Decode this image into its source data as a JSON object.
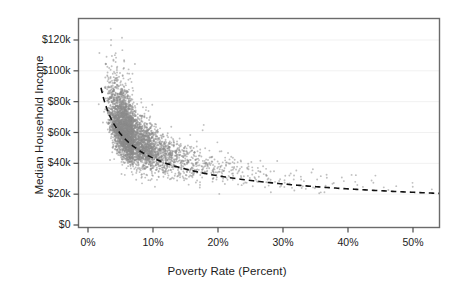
{
  "chart_data": {
    "type": "scatter",
    "title": "",
    "subtitle": "",
    "xlabel": "Poverty Rate (Percent)",
    "ylabel": "Median Household Income",
    "xlim": [
      0,
      54
    ],
    "ylim": [
      0,
      132000
    ],
    "xticks": [
      0,
      10,
      20,
      30,
      40,
      50
    ],
    "xticklabels": [
      "0%",
      "10%",
      "20%",
      "30%",
      "40%",
      "50%"
    ],
    "yticks": [
      0,
      20000,
      40000,
      60000,
      80000,
      100000,
      120000
    ],
    "yticklabels": [
      "$0",
      "$20k",
      "$40k",
      "$60k",
      "$80k",
      "$100k",
      "$120k"
    ],
    "grid": "horizontal-faint",
    "legend": "none",
    "point_color": "#8c8c8c",
    "point_opacity": 0.55,
    "point_size": 1.9,
    "frame_color": "#6b6b6b",
    "trendline": {
      "style": "dashed",
      "color": "#111111",
      "width": 1.6,
      "shape": "power-decay",
      "x_start": 2.0,
      "y_start": 89000,
      "x_end": 54.0,
      "y_end": 20500,
      "description": "Dashed fitted curve decaying from about $89k at 2% poverty to about $20.5k at 54% poverty"
    },
    "series": [
      {
        "name": "U.S. counties",
        "n_points": 3140,
        "x": [
          1.9,
          2.4,
          2.6,
          2.8,
          3.0,
          3.1,
          3.2,
          3.3,
          3.4,
          3.5,
          3.6,
          3.7,
          3.8,
          3.9,
          4.0,
          4.1,
          4.2,
          4.3,
          4.4,
          4.5,
          4.6,
          4.7,
          4.8,
          4.9,
          5.0,
          5.1,
          5.2,
          5.3,
          5.4,
          5.5,
          5.6,
          5.7,
          5.8,
          5.9,
          6.0,
          6.1,
          6.2,
          6.3,
          6.4,
          6.5,
          6.6,
          6.7,
          6.8,
          6.9,
          7.0,
          7.2,
          7.4,
          7.6,
          7.8,
          8.0,
          8.2,
          8.4,
          8.6,
          8.8,
          9.0,
          9.2,
          9.4,
          9.6,
          9.8,
          10.0,
          10.3,
          10.6,
          10.9,
          11.2,
          11.5,
          11.8,
          12.1,
          12.4,
          12.7,
          13.0,
          13.4,
          13.8,
          14.2,
          14.6,
          15.0,
          15.4,
          15.8,
          16.2,
          16.6,
          17.0,
          17.5,
          18.0,
          18.5,
          19.0,
          19.5,
          20.0,
          20.5,
          21.0,
          21.5,
          22.0,
          22.6,
          23.2,
          23.8,
          24.4,
          25.0,
          25.7,
          26.4,
          27.1,
          27.8,
          28.5,
          29.3,
          30.1,
          30.9,
          31.7,
          32.5,
          33.4,
          34.3,
          35.2,
          36.1,
          37.0,
          38.2,
          39.4,
          40.6,
          41.8,
          43.0,
          44.5,
          46.0,
          47.5,
          49.0,
          51.0,
          53.0
        ],
        "y_median": [
          86000,
          84000,
          82000,
          79000,
          77000,
          76000,
          75000,
          74000,
          73000,
          72000,
          71000,
          70500,
          70000,
          69000,
          68500,
          68000,
          67500,
          67000,
          66500,
          66000,
          65500,
          65000,
          64500,
          64000,
          63500,
          63000,
          62500,
          62000,
          61500,
          61000,
          60500,
          60000,
          59500,
          59200,
          59000,
          58500,
          58200,
          58000,
          57500,
          57000,
          56800,
          56500,
          56200,
          56000,
          55500,
          55000,
          54500,
          54000,
          53500,
          53000,
          52500,
          52000,
          51500,
          51000,
          50500,
          50000,
          49600,
          49200,
          48800,
          48500,
          48000,
          47500,
          47000,
          46600,
          46200,
          45800,
          45400,
          45000,
          44600,
          44200,
          43600,
          43000,
          42400,
          41900,
          41400,
          40900,
          40400,
          40000,
          39600,
          39200,
          38700,
          38200,
          37700,
          37200,
          36800,
          36400,
          36000,
          35600,
          35200,
          34900,
          34500,
          34100,
          33700,
          33300,
          33000,
          32600,
          32200,
          31900,
          31500,
          31200,
          30800,
          30500,
          30200,
          29900,
          29600,
          29300,
          29000,
          28700,
          28400,
          28200,
          27800,
          27400,
          27000,
          26700,
          26300,
          25900,
          25400,
          25000,
          24500,
          23800,
          23000
        ],
        "y_spread_high": [
          110000,
          114000,
          112000,
          109000,
          108000,
          107000,
          106000,
          105000,
          104000,
          103000,
          102000,
          101000,
          100000,
          99000,
          98000,
          97000,
          96000,
          95000,
          94000,
          93000,
          92500,
          92000,
          91500,
          91000,
          90500,
          90000,
          89500,
          89000,
          88500,
          88000,
          87000,
          86000,
          85000,
          84000,
          83000,
          82000,
          81500,
          81000,
          80500,
          80000,
          79000,
          78000,
          77500,
          77000,
          76000,
          75000,
          74000,
          73000,
          72000,
          71000,
          70000,
          69000,
          68000,
          67000,
          66500,
          66000,
          65000,
          64500,
          64000,
          63500,
          62500,
          61500,
          61000,
          60500,
          60000,
          59000,
          58500,
          58000,
          57500,
          57000,
          56000,
          55500,
          55000,
          54000,
          53500,
          53000,
          52500,
          52000,
          51500,
          51000,
          50000,
          49500,
          49000,
          48500,
          48000,
          47500,
          47000,
          46500,
          46000,
          45500,
          45000,
          44500,
          44000,
          43500,
          43000,
          42500,
          42000,
          41500,
          41000,
          40500,
          40000,
          39500,
          39000,
          38500,
          38000,
          37500,
          37000,
          36500,
          36000,
          35500,
          35000,
          34500,
          34000,
          33500,
          33000,
          32500,
          32000,
          31500,
          31000,
          30500,
          30000
        ],
        "y_spread_low": [
          68000,
          66000,
          64000,
          62000,
          60000,
          59000,
          58000,
          57000,
          56000,
          55000,
          54000,
          53500,
          53000,
          52000,
          51500,
          51000,
          50500,
          50000,
          49500,
          49000,
          48500,
          48000,
          47500,
          47000,
          46500,
          46000,
          45500,
          45000,
          44800,
          44500,
          44200,
          44000,
          43500,
          43200,
          43000,
          42500,
          42200,
          42000,
          41500,
          41000,
          40800,
          40500,
          40200,
          40000,
          39500,
          39000,
          38600,
          38200,
          37800,
          37500,
          37000,
          36600,
          36200,
          35800,
          35500,
          35000,
          34700,
          34400,
          34100,
          33800,
          33400,
          33000,
          32600,
          32300,
          32000,
          31700,
          31400,
          31100,
          30800,
          30500,
          30100,
          29700,
          29300,
          29000,
          28700,
          28400,
          28100,
          27800,
          27500,
          27200,
          26800,
          26500,
          26200,
          25900,
          25600,
          25300,
          25000,
          24800,
          24500,
          24300,
          24000,
          23800,
          23500,
          23300,
          23000,
          22800,
          22600,
          22400,
          22200,
          22000,
          21800,
          21600,
          21400,
          21200,
          21000,
          20900,
          20700,
          20500,
          20300,
          20200,
          20000,
          19800,
          19600,
          19400,
          19200,
          19000,
          18800,
          18600,
          18400,
          18200,
          18000
        ],
        "density": [
          2,
          3,
          5,
          8,
          12,
          14,
          16,
          18,
          21,
          24,
          27,
          30,
          33,
          36,
          40,
          43,
          46,
          50,
          54,
          58,
          62,
          66,
          70,
          74,
          78,
          82,
          85,
          88,
          90,
          92,
          94,
          95,
          96,
          96,
          96,
          95,
          94,
          93,
          92,
          91,
          90,
          89,
          88,
          87,
          86,
          84,
          82,
          80,
          78,
          76,
          74,
          72,
          70,
          68,
          66,
          64,
          62,
          60,
          58,
          56,
          53,
          50,
          47,
          44,
          42,
          40,
          38,
          36,
          34,
          32,
          30,
          28,
          26,
          24,
          22,
          21,
          20,
          19,
          18,
          17,
          16,
          15,
          14,
          13,
          12,
          11,
          11,
          10,
          10,
          9,
          9,
          8,
          8,
          7,
          7,
          6,
          6,
          6,
          5,
          5,
          5,
          4,
          4,
          4,
          4,
          3,
          3,
          3,
          3,
          3,
          2,
          2,
          2,
          2,
          2,
          2,
          2,
          1,
          1,
          1,
          1
        ]
      }
    ]
  }
}
